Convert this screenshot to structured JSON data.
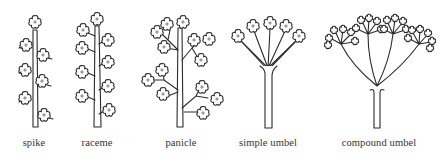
{
  "figure": {
    "ink_color": "#2b2b2b",
    "background": "#ffffff"
  },
  "inflorescences": [
    {
      "id": "spike",
      "label": "spike",
      "label_x": 34
    },
    {
      "id": "raceme",
      "label": "raceme",
      "label_x": 97
    },
    {
      "id": "panicle",
      "label": "panicle",
      "label_x": 181
    },
    {
      "id": "simple-umbel",
      "label": "simple umbel",
      "label_x": 268
    },
    {
      "id": "compound-umbel",
      "label": "compound umbel",
      "label_x": 379
    }
  ]
}
